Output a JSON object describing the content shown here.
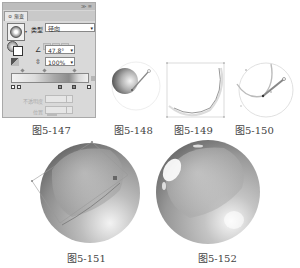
{
  "panel": {
    "tab_label": "≎ 渐变",
    "panel_controls": "≫ ≡",
    "type_label": "类型",
    "type_value": "径向",
    "angle_value": "47.8°",
    "aspect_ratio_value": "100%",
    "opacity_label": "不透明度",
    "location_label": "位置",
    "dropdown_glyph": "▾",
    "icons": {
      "angle": "∠",
      "ratio": "⇳",
      "swatch_arrow": "▾"
    }
  },
  "figures": [
    {
      "id": "fig-5-147",
      "caption": "图5-147"
    },
    {
      "id": "fig-5-148",
      "caption": "图5-148"
    },
    {
      "id": "fig-5-149",
      "caption": "图5-149"
    },
    {
      "id": "fig-5-150",
      "caption": "图5-150"
    },
    {
      "id": "fig-5-151",
      "caption": "图5-151"
    },
    {
      "id": "fig-5-152",
      "caption": "图5-152"
    }
  ],
  "colors": {
    "panel_bg": "#d9d9d9",
    "gradient_light": "#f2f2f2",
    "gradient_dark": "#8c8c8c",
    "sphere_mid": "#9e9e9e"
  }
}
